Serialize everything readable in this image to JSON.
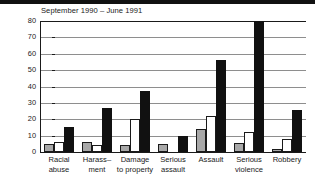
{
  "chart_data": {
    "type": "bar",
    "title": "September 1990 – June 1991",
    "xlabel": "",
    "ylabel": "",
    "ylim": [
      0,
      80
    ],
    "yticks": [
      0,
      10,
      20,
      30,
      40,
      50,
      60,
      70,
      80
    ],
    "grid": true,
    "legend_position": "none",
    "categories": [
      "Racial abuse",
      "Harass-ment",
      "Damage to property",
      "Serious assault",
      "Assault",
      "Serious violence",
      "Robbery"
    ],
    "category_lines": [
      [
        "Racial",
        "abuse"
      ],
      [
        "Harass–",
        "ment"
      ],
      [
        "Damage",
        "to property"
      ],
      [
        "Serious",
        "assault"
      ],
      [
        "Assault",
        ""
      ],
      [
        "Serious",
        "violence"
      ],
      [
        "Robbery",
        ""
      ]
    ],
    "series": [
      {
        "name": "grey",
        "color": "#a8a8a8",
        "values": [
          5,
          6,
          4,
          5,
          14,
          5.5,
          2
        ]
      },
      {
        "name": "white",
        "color": "#ffffff",
        "values": [
          6,
          4,
          20,
          0,
          22,
          12,
          8
        ]
      },
      {
        "name": "black",
        "color": "#111111",
        "values": [
          15,
          27,
          37,
          10,
          56,
          80,
          25.5
        ]
      }
    ]
  },
  "axis": {
    "ytick_labels": [
      "0",
      "10",
      "20",
      "30",
      "40",
      "50",
      "60",
      "70",
      "80"
    ]
  }
}
